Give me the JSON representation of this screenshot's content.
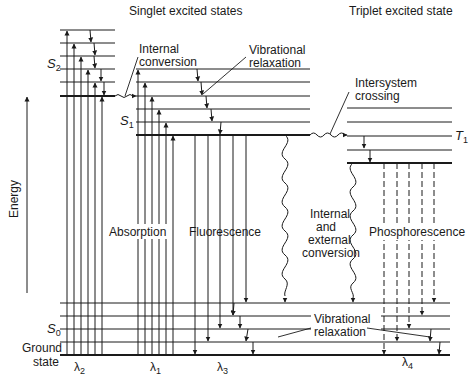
{
  "headers": {
    "singlet": "Singlet excited states",
    "triplet": "Triplet excited state"
  },
  "axis": {
    "label": "Energy"
  },
  "states": {
    "s2": {
      "letter": "S",
      "sub": "2"
    },
    "s1": {
      "letter": "S",
      "sub": "1"
    },
    "s0": {
      "letter": "S",
      "sub": "0"
    },
    "t1": {
      "letter": "T",
      "sub": "1"
    },
    "ground_line1": "Ground",
    "ground_line2": "state"
  },
  "processes": {
    "internal_conversion_1": "Internal",
    "internal_conversion_2": "conversion",
    "vib_relax_top_1": "Vibrational",
    "vib_relax_top_2": "relaxation",
    "isc_1": "Intersystem",
    "isc_2": "crossing",
    "absorption": "Absorption",
    "fluorescence": "Fluorescence",
    "iec_1": "Internal",
    "iec_2": "and",
    "iec_3": "external",
    "iec_4": "conversion",
    "phosphorescence": "Phosphorescence",
    "vib_relax_bottom_1": "Vibrational",
    "vib_relax_bottom_2": "relaxation"
  },
  "wavelengths": {
    "l2": {
      "sym": "λ",
      "sub": "2"
    },
    "l1": {
      "sym": "λ",
      "sub": "1"
    },
    "l3": {
      "sym": "λ",
      "sub": "3"
    },
    "l4": {
      "sym": "λ",
      "sub": "4"
    }
  },
  "colors": {
    "ink": "#1a1a1a",
    "background": "#ffffff"
  }
}
